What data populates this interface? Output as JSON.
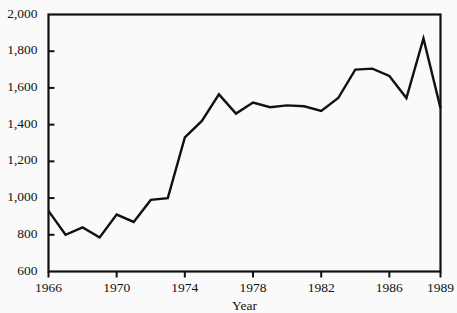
{
  "chart_data": {
    "type": "line",
    "title": "",
    "subtitle": "",
    "xlabel": "Year",
    "ylabel": "",
    "x": [
      1966,
      1967,
      1968,
      1969,
      1970,
      1971,
      1972,
      1973,
      1974,
      1975,
      1976,
      1977,
      1978,
      1979,
      1980,
      1981,
      1982,
      1983,
      1984,
      1985,
      1986,
      1987,
      1988,
      1989
    ],
    "values": [
      930,
      800,
      840,
      785,
      910,
      870,
      990,
      1000,
      1330,
      1420,
      1565,
      1460,
      1520,
      1495,
      1505,
      1500,
      1475,
      1545,
      1700,
      1705,
      1665,
      1545,
      1870,
      1490
    ],
    "series": [
      {
        "name": "series-1",
        "values": [
          930,
          800,
          840,
          785,
          910,
          870,
          990,
          1000,
          1330,
          1420,
          1565,
          1460,
          1520,
          1495,
          1505,
          1500,
          1475,
          1545,
          1700,
          1705,
          1665,
          1545,
          1870,
          1490
        ]
      }
    ],
    "xlim": [
      1966,
      1989
    ],
    "ylim": [
      600,
      2000
    ],
    "xticks": [
      1966,
      1970,
      1974,
      1978,
      1982,
      1986,
      1989
    ],
    "xtick_labels": [
      "1966",
      "1970",
      "1974",
      "1978",
      "1982",
      "1986",
      "1989"
    ],
    "yticks": [
      600,
      800,
      1000,
      1200,
      1400,
      1600,
      1800,
      2000
    ],
    "ytick_labels": [
      "600",
      "800",
      "1,000",
      "1,200",
      "1,400",
      "1,600",
      "1,800",
      "2,000"
    ],
    "grid": false,
    "legend": null,
    "legend_position": "none",
    "line_color": "#111111",
    "background_color": "#fbfafa",
    "annotations": []
  }
}
